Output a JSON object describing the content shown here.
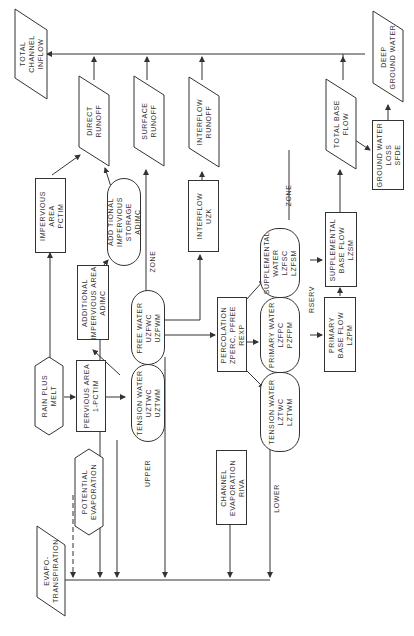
{
  "diagram": {
    "title": "",
    "orientation": "rotated-90-ccw",
    "nodes": {
      "total_channel_inflow": "TOTAL\nCHANNEL\nINFLOW",
      "direct_runoff": "DIRECT\nRUNOFF",
      "surface_runoff": "SURFACE\nRUNOFF",
      "interflow_runoff": "INTERFLOW\nRUNOFF",
      "total_base_flow": "TOTAL BASE\nFLOW",
      "deep_ground_water": "DEEP\nGROUND WATER",
      "ground_water_loss": "GROUND WATER\nLOSS\nSFDE",
      "impervious_area": "IMPERVIOUS\nAREA\nPCTIM",
      "additional_impervious_storage": "ADD TIONAL\nIMPERVIOUS\nSTORAGE\nADIMC",
      "interflow": "INTERFLOW\nUZK",
      "additional_impervious_area": "ADDITIONAL\nIMPERVIOUS AREA\nADIMC",
      "free_water_upper": "FREE WATER\nUZFWC\nUZFWM",
      "supplemental_water": "SUPPLEMENTAL\nWATER\nLZFSC\nLZFSM",
      "supplemental_base_flow": "SUPPLEMENTAL\nBASE FLOW\nLZSM",
      "percolation": "PERCOLATION\nZPERC, PFREE\nREXP",
      "primary_water": "PRIMARY WATER\nLZFPC\nPZFPM",
      "primary_base_flow": "PRIMARY\nBASE FLOW\nLZPM",
      "rain_plus_melt": "RAIN PLUS\nMELT",
      "pervious_area": "PERVIOUS AREA\n1-PCTIM",
      "tension_water_upper": "TENSION WATER\nUZTWC\nUZTWM",
      "tension_water_lower": "TENSION WATER\nLZTWC\nLZTWM",
      "potential_evaporation": "POTENTIAL\nEVAPORATION",
      "channel_evaporation": "CHANNEL\nEVAPORATION\nRIVA",
      "evapotranspiration": "EVAPO-\nTRANSPIRATION"
    },
    "labels": {
      "zone_upper_top": "ZONE",
      "zone_upper_bottom": "UPPER",
      "zone_lower_top": "ZONE",
      "zone_lower_bottom": "LOWER",
      "rserv": "RSERV"
    },
    "colors": {
      "line": "#333333",
      "background": "#ffffff"
    }
  }
}
